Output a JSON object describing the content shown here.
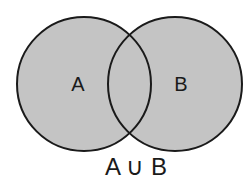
{
  "diagram": {
    "type": "venn",
    "sets": [
      {
        "label": "A",
        "fill": "#c4c4c4",
        "stroke": "#1a1a1a"
      },
      {
        "label": "B",
        "fill": "#c4c4c4",
        "stroke": "#1a1a1a"
      }
    ],
    "caption": "A ∪ B",
    "shaded_region": "union"
  }
}
